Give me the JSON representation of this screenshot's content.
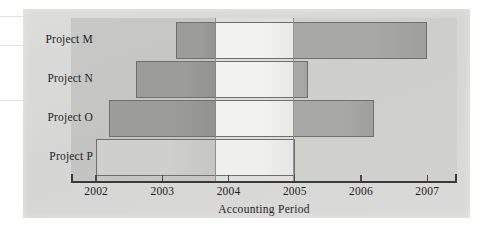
{
  "figure": {
    "kind": "gantt-bar-chart",
    "panel_background": "#d8d8d6",
    "ink_color": "#232321"
  },
  "chart_data": {
    "type": "bar",
    "orientation": "horizontal",
    "title": "",
    "subtitle": "",
    "xlabel": "Accounting Period",
    "ylabel": "",
    "categories": [
      "Project M",
      "Project N",
      "Project O",
      "Project P"
    ],
    "xlim": [
      2001.62,
      2007.45
    ],
    "xticks": [
      2002,
      2003,
      2004,
      2005,
      2006,
      2007
    ],
    "xtick_labels": [
      "2002",
      "2003",
      "2004",
      "2005",
      "2006",
      "2007"
    ],
    "grid": false,
    "legend": null,
    "bars": [
      {
        "category": "Project M",
        "start": 2003.2,
        "end": 2007.0,
        "duration": 3.8,
        "fill": "#9a9a98",
        "border": "#6f6f6d"
      },
      {
        "category": "Project N",
        "start": 2002.6,
        "end": 2005.2,
        "duration": 2.6,
        "fill": "#9a9a98",
        "border": "#6f6f6d"
      },
      {
        "category": "Project O",
        "start": 2002.2,
        "end": 2006.2,
        "duration": 4.0,
        "fill": "#9a9a98",
        "border": "#6f6f6d"
      },
      {
        "category": "Project P",
        "start": 2002.0,
        "end": 2005.0,
        "duration": 3.0,
        "fill": "#c9c9c7",
        "border": "#6f6f6d"
      }
    ],
    "shading_bands": [
      {
        "from": 2001.62,
        "to": 2003.8,
        "tone": "dark",
        "color": "#9a9a98"
      },
      {
        "from": 2003.8,
        "to": 2004.98,
        "tone": "light",
        "color": "#f0f0ee"
      },
      {
        "from": 2004.98,
        "to": 2007.45,
        "tone": "medium",
        "color": "#bdbdbb"
      }
    ]
  }
}
